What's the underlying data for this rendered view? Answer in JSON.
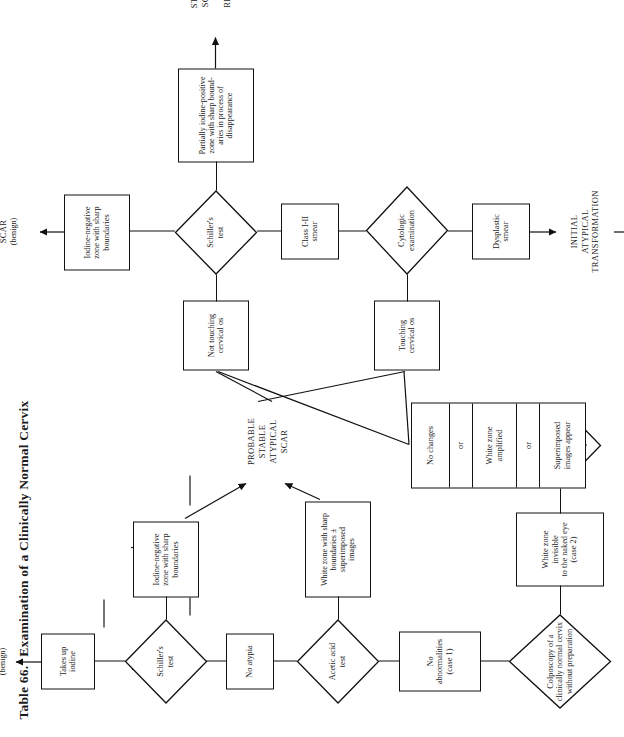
{
  "page": {
    "table_number": "Table 66.",
    "title": "Examination of a Clinically Normal Cervix"
  },
  "flow": {
    "start": {
      "label_line1": "Colposcopy of a",
      "label_line2": "clinically normal cervix",
      "label_line3": "without preparation"
    },
    "case1": {
      "line1": "No abnormalities",
      "line2": "(case 1)"
    },
    "case2": {
      "line1": "White zone invisible",
      "line2": "to the naked eye",
      "line3": "(case 2)"
    },
    "acetic_test_1": {
      "line1": "Acetic acid",
      "line2": "test"
    },
    "acetic_test_2": {
      "line1": "Acetic acid",
      "line2": "test"
    },
    "no_atypia": {
      "line1": "No atypia"
    },
    "white_zone_sharp": {
      "line1": "White zone with sharp",
      "line2": "boundaries ± superimposed",
      "line3": "images"
    },
    "changes_box": {
      "cells": [
        "No changes",
        "or",
        "White zone\namplified",
        "or",
        "Superimposed\nimages appear"
      ]
    },
    "schiller_test_1": {
      "line1": "Schiller's",
      "line2": "test"
    },
    "schiller_test_2": {
      "line1": "Schiller's",
      "line2": "test"
    },
    "takes_up_iodine": {
      "line1": "Takes up",
      "line2": "iodine"
    },
    "iodine_negative_1": {
      "line1": "Iodine-negative",
      "line2": "zone with sharp",
      "line3": "boundaries"
    },
    "iodine_negative_2": {
      "line1": "Iodine-negative",
      "line2": "zone with sharp",
      "line3": "boundaries"
    },
    "partially_iodine_positive": {
      "line1": "Partially iodine-positive",
      "line2": "zone with sharp bound-",
      "line3": "aries in process of",
      "line4": "disappearance"
    },
    "not_touching_os": {
      "line1": "Not touching",
      "line2": "cervical os"
    },
    "touching_os": {
      "line1": "Touching",
      "line2": "cervical os"
    },
    "cytologic_exam": {
      "line1": "Cytologic",
      "line2": "examination"
    },
    "class_smear": {
      "line1": "Class I-II",
      "line2": "smear"
    },
    "dysplastic_smear": {
      "line1": "Dysplastic",
      "line2": "smear"
    },
    "directed_biopsy": {
      "line1": "Directed",
      "line2": "Biopsy"
    }
  },
  "outcomes": {
    "normal_cervix": {
      "line1": "NORMAL",
      "line2": "CERVIX",
      "line3": "(benign)"
    },
    "probable_stable_atypical_scar": {
      "line1": "PROBABLE",
      "line2": "STABLE",
      "line3": "ATYPICAL",
      "line4": "SCAR"
    },
    "stable_atypical_scar": {
      "line1": "STABLE",
      "line2": "ATYPICAL",
      "line3": "SCAR",
      "line4": "(benign)"
    },
    "stable_atypical_scar_regularization": {
      "line1": "STABLE ATYPICAL",
      "line2": "SCAR IN PROCESS",
      "line3": "OF",
      "line4": "REGULARIZATION",
      "line5": "(benign)"
    },
    "initial_atypical_transformation": {
      "line1": "INITIAL",
      "line2": "ATYPICAL",
      "line3": "TRANSFORMATION"
    }
  },
  "colors": {
    "ink": "#111111",
    "paper": "#ffffff"
  }
}
